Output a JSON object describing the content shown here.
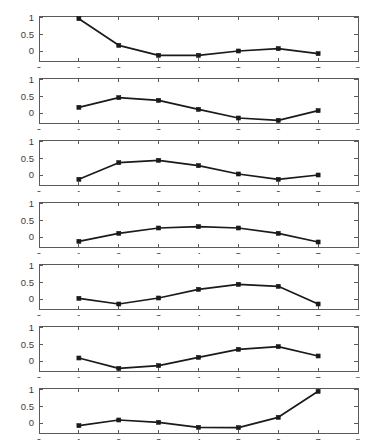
{
  "figure": {
    "title": "",
    "background": "#ffffff",
    "line_color": "#1a1a1a",
    "axis_color": "#5a5a5a",
    "subplot_count": 7
  },
  "chart_data": [
    {
      "type": "line",
      "title": "",
      "xlabel": "",
      "ylabel": "",
      "x": [
        1,
        2,
        3,
        4,
        5,
        6,
        7
      ],
      "values": [
        0.97,
        0.17,
        -0.13,
        -0.13,
        0.0,
        0.07,
        -0.08
      ],
      "xlim": [
        0,
        8
      ],
      "ylim": [
        -0.3,
        1.05
      ],
      "xticks": [
        0,
        1,
        2,
        3,
        4,
        5,
        6,
        7,
        8
      ],
      "xticklabels": [
        "0",
        "1",
        "2",
        "3",
        "4",
        "5",
        "6",
        "7",
        "8"
      ],
      "yticks": [
        0,
        0.5,
        1
      ],
      "yticklabels": [
        "0",
        "0.5",
        "1"
      ],
      "marker": "square",
      "grid": false,
      "legend": null
    },
    {
      "type": "line",
      "title": "",
      "xlabel": "",
      "ylabel": "",
      "x": [
        1,
        2,
        3,
        4,
        5,
        6,
        7
      ],
      "values": [
        0.17,
        0.46,
        0.38,
        0.11,
        -0.15,
        -0.22,
        0.07
      ],
      "xlim": [
        0,
        8
      ],
      "ylim": [
        -0.3,
        1.05
      ],
      "xticks": [
        0,
        1,
        2,
        3,
        4,
        5,
        6,
        7,
        8
      ],
      "xticklabels": [
        "0",
        "1",
        "2",
        "3",
        "4",
        "5",
        "6",
        "7",
        "8"
      ],
      "yticks": [
        0,
        0.5,
        1
      ],
      "yticklabels": [
        "0",
        "0.5",
        "1"
      ],
      "marker": "square",
      "grid": false,
      "legend": null
    },
    {
      "type": "line",
      "title": "",
      "xlabel": "",
      "ylabel": "",
      "x": [
        1,
        2,
        3,
        4,
        5,
        6,
        7
      ],
      "values": [
        -0.13,
        0.37,
        0.44,
        0.28,
        0.03,
        -0.13,
        0.0
      ],
      "xlim": [
        0,
        8
      ],
      "ylim": [
        -0.3,
        1.05
      ],
      "xticks": [
        0,
        1,
        2,
        3,
        4,
        5,
        6,
        7,
        8
      ],
      "xticklabels": [
        "0",
        "1",
        "2",
        "3",
        "4",
        "5",
        "6",
        "7",
        "8"
      ],
      "yticks": [
        0,
        0.5,
        1
      ],
      "yticklabels": [
        "0",
        "0.5",
        "1"
      ],
      "marker": "square",
      "grid": false,
      "legend": null
    },
    {
      "type": "line",
      "title": "",
      "xlabel": "",
      "ylabel": "",
      "x": [
        1,
        2,
        3,
        4,
        5,
        6,
        7
      ],
      "values": [
        -0.13,
        0.11,
        0.27,
        0.31,
        0.27,
        0.11,
        -0.15
      ],
      "xlim": [
        0,
        8
      ],
      "ylim": [
        -0.3,
        1.05
      ],
      "xticks": [
        0,
        1,
        2,
        3,
        4,
        5,
        6,
        7,
        8
      ],
      "xticklabels": [
        "0",
        "1",
        "2",
        "3",
        "4",
        "5",
        "6",
        "7",
        "8"
      ],
      "yticks": [
        0,
        0.5,
        1
      ],
      "yticklabels": [
        "0",
        "0.5",
        "1"
      ],
      "marker": "square",
      "grid": false,
      "legend": null
    },
    {
      "type": "line",
      "title": "",
      "xlabel": "",
      "ylabel": "",
      "x": [
        1,
        2,
        3,
        4,
        5,
        6,
        7
      ],
      "values": [
        0.02,
        -0.15,
        0.03,
        0.29,
        0.44,
        0.38,
        -0.15
      ],
      "xlim": [
        0,
        8
      ],
      "ylim": [
        -0.3,
        1.05
      ],
      "xticks": [
        0,
        1,
        2,
        3,
        4,
        5,
        6,
        7,
        8
      ],
      "xticklabels": [
        "0",
        "1",
        "2",
        "3",
        "4",
        "5",
        "6",
        "7",
        "8"
      ],
      "yticks": [
        0,
        0.5,
        1
      ],
      "yticklabels": [
        "0",
        "0.5",
        "1"
      ],
      "marker": "square",
      "grid": false,
      "legend": null
    },
    {
      "type": "line",
      "title": "",
      "xlabel": "",
      "ylabel": "",
      "x": [
        1,
        2,
        3,
        4,
        5,
        6,
        7
      ],
      "values": [
        0.09,
        -0.22,
        -0.14,
        0.11,
        0.35,
        0.43,
        0.15
      ],
      "xlim": [
        0,
        8
      ],
      "ylim": [
        -0.3,
        1.05
      ],
      "xticks": [
        0,
        1,
        2,
        3,
        4,
        5,
        6,
        7,
        8
      ],
      "xticklabels": [
        "0",
        "1",
        "2",
        "3",
        "4",
        "5",
        "6",
        "7",
        "8"
      ],
      "yticks": [
        0,
        0.5,
        1
      ],
      "yticklabels": [
        "0",
        "0.5",
        "1"
      ],
      "marker": "square",
      "grid": false,
      "legend": null
    },
    {
      "type": "line",
      "title": "",
      "xlabel": "",
      "ylabel": "",
      "x": [
        1,
        2,
        3,
        4,
        5,
        6,
        7
      ],
      "values": [
        -0.08,
        0.09,
        0.02,
        -0.13,
        -0.14,
        0.17,
        0.95
      ],
      "xlim": [
        0,
        8
      ],
      "ylim": [
        -0.3,
        1.05
      ],
      "xticks": [
        0,
        1,
        2,
        3,
        4,
        5,
        6,
        7,
        8
      ],
      "xticklabels": [
        "0",
        "1",
        "2",
        "3",
        "4",
        "5",
        "6",
        "7",
        "8"
      ],
      "yticks": [
        0,
        0.5,
        1
      ],
      "yticklabels": [
        "0",
        "0.5",
        "1"
      ],
      "marker": "square",
      "grid": false,
      "legend": null
    }
  ]
}
